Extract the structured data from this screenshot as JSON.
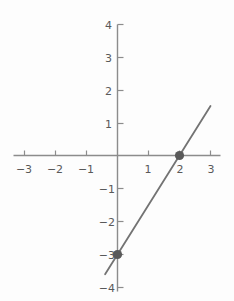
{
  "chart_data": {
    "type": "line",
    "title": "",
    "subtitle": "",
    "xlabel": "",
    "ylabel": "",
    "xlim": [
      -3.4,
      3.4
    ],
    "ylim": [
      -4.2,
      4.2
    ],
    "xticks": [
      -3,
      -2,
      -1,
      1,
      2,
      3
    ],
    "yticks": [
      4,
      3,
      2,
      1,
      -1,
      -2,
      -3,
      -4
    ],
    "xtick_labels": [
      "−3",
      "−2",
      "−1",
      "1",
      "2",
      "3"
    ],
    "ytick_labels": [
      "4",
      "3",
      "2",
      "1",
      "−1",
      "−2",
      "−3",
      "−4"
    ],
    "grid": false,
    "legend": false,
    "legend_position": "none",
    "axis_style": "centered-cross",
    "series": [
      {
        "name": "line",
        "type": "line",
        "equation": "y = 1.5x - 3",
        "slope": 1.5,
        "intercept": -3,
        "x": [
          -0.4,
          3.0
        ],
        "y": [
          -3.6,
          1.5
        ],
        "color": "#737373",
        "width": 1.8
      },
      {
        "name": "marked-points",
        "type": "scatter",
        "points": [
          {
            "x": 0,
            "y": -3,
            "label": "(0, -3)"
          },
          {
            "x": 2,
            "y": 0,
            "label": "(2, 0)"
          }
        ],
        "color": "#595959",
        "marker": "filled-circle",
        "marker_size": 5
      }
    ],
    "axis_color": "#8c8c8c",
    "tick_color": "#8c8c8c",
    "label_color": "#595959",
    "background_color": "#fdfdfd"
  },
  "figure": {
    "name": "coordinate-plane-with-line"
  }
}
